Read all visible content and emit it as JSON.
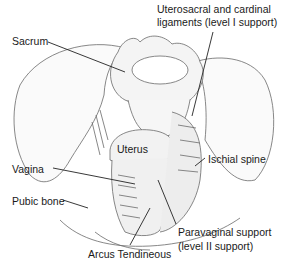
{
  "diagram": {
    "labels": {
      "uterosacral_line1": "Uterosacral and cardinal",
      "uterosacral_line2": "ligaments (level I support)",
      "sacrum": "Sacrum",
      "uterus": "Uterus",
      "ischial_spine": "Ischial spine",
      "vagina": "Vagina",
      "pubic_bone": "Pubic bone",
      "paravaginal_line1": "Paravaginal support",
      "paravaginal_line2": "(level II support)",
      "arcus_tendineous": "Arcus Tendineous"
    },
    "colors": {
      "ink": "#1a1a1a",
      "line": "#555555",
      "fill": "#f4f4f4",
      "background": "#ffffff"
    }
  }
}
